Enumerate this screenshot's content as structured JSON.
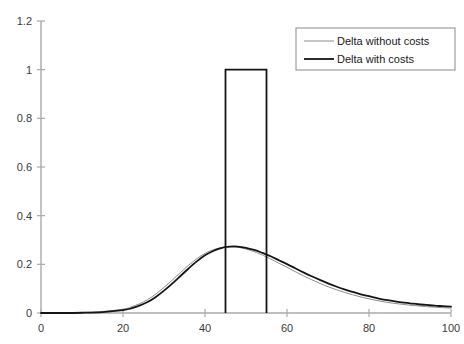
{
  "chart_data": {
    "type": "line",
    "title": "",
    "xlabel": "",
    "ylabel": "",
    "xlim": [
      0,
      100
    ],
    "ylim": [
      0,
      1.2
    ],
    "grid": false,
    "legend_position": "top-right",
    "xticks": [
      "0",
      "20",
      "40",
      "60",
      "80",
      "100"
    ],
    "xtick_values": [
      0,
      20,
      40,
      60,
      80,
      100
    ],
    "yticks": [
      "0",
      "0.2",
      "0.4",
      "0.6",
      "0.8",
      "1",
      "1.2"
    ],
    "ytick_values": [
      0,
      0.2,
      0.4,
      0.6,
      0.8,
      1,
      1.2
    ],
    "x": [
      0,
      5,
      10,
      15,
      20,
      22,
      24,
      26,
      28,
      30,
      32,
      34,
      36,
      38,
      40,
      42,
      44,
      45,
      46,
      48,
      50,
      52,
      54,
      55,
      56,
      58,
      60,
      62,
      64,
      66,
      68,
      70,
      72,
      74,
      76,
      78,
      80,
      82,
      84,
      86,
      88,
      90,
      92,
      94,
      96,
      98,
      100
    ],
    "series": [
      {
        "name": "Delta without costs",
        "color": "#8c8c8c",
        "linewidth": 1.0,
        "values": [
          0.0,
          0.0,
          0.002,
          0.006,
          0.016,
          0.025,
          0.038,
          0.055,
          0.078,
          0.105,
          0.135,
          0.166,
          0.196,
          0.223,
          0.245,
          0.26,
          0.269,
          0.271,
          0.272,
          0.27,
          0.263,
          0.252,
          0.238,
          0.23,
          0.222,
          0.205,
          0.188,
          0.17,
          0.153,
          0.137,
          0.122,
          0.108,
          0.096,
          0.085,
          0.075,
          0.066,
          0.058,
          0.051,
          0.045,
          0.04,
          0.036,
          0.032,
          0.029,
          0.026,
          0.024,
          0.022,
          0.02
        ]
      },
      {
        "name": "Delta with costs",
        "color": "#151515",
        "linewidth": 1.8,
        "values": [
          0.0,
          0.0,
          0.001,
          0.004,
          0.012,
          0.019,
          0.03,
          0.045,
          0.066,
          0.092,
          0.121,
          0.152,
          0.183,
          0.212,
          0.237,
          0.255,
          0.267,
          0.271,
          0.273,
          0.273,
          0.268,
          0.259,
          0.247,
          0.24,
          0.233,
          0.217,
          0.201,
          0.184,
          0.167,
          0.151,
          0.136,
          0.122,
          0.109,
          0.097,
          0.087,
          0.077,
          0.069,
          0.061,
          0.054,
          0.049,
          0.044,
          0.04,
          0.036,
          0.033,
          0.03,
          0.028,
          0.026
        ]
      }
    ],
    "annotations": [
      {
        "name": "rectangular-pulse",
        "description": "Rectangular step from x=45 to x=55 rising to y=1.0",
        "x_start": 45,
        "x_end": 55,
        "height": 1.0,
        "color": "#151515",
        "linewidth": 1.8
      }
    ],
    "legend": [
      {
        "label": "Delta without costs",
        "color": "#8c8c8c",
        "linewidth": 1.0
      },
      {
        "label": "Delta with costs",
        "color": "#151515",
        "linewidth": 1.8
      }
    ],
    "axis_color": "#aaaaaa"
  }
}
